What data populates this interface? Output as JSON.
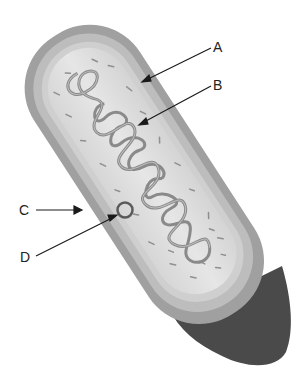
{
  "diagram": {
    "labels": [
      {
        "id": "A",
        "text": "A",
        "points_to": "cell wall / outer layer"
      },
      {
        "id": "B",
        "text": "B",
        "points_to": "nucleoid DNA"
      },
      {
        "id": "C",
        "text": "C",
        "points_to": "outer capsule edge"
      },
      {
        "id": "D",
        "text": "D",
        "points_to": "plasmid"
      }
    ],
    "colors": {
      "capsule": "#9a9a9a",
      "wall": "#b9b9b9",
      "membrane": "#cfcfcf",
      "cytoplasm": "#dedede",
      "dna": "#8a8a8a",
      "underside": "#4a4a4a",
      "arrow": "#1a1a1a"
    }
  }
}
